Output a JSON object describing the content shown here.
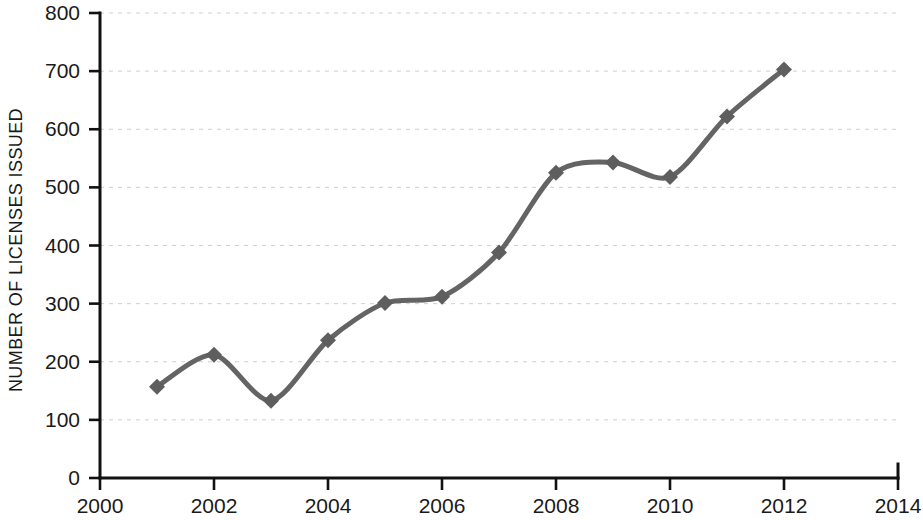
{
  "chart_data": {
    "type": "line",
    "title": "",
    "xlabel": "",
    "ylabel": "NUMBER OF LICENSES ISSUED",
    "xlim": [
      2000,
      2014
    ],
    "ylim": [
      0,
      800
    ],
    "x_ticks": [
      "2000",
      "2002",
      "2004",
      "2006",
      "2008",
      "2010",
      "2012",
      "2014"
    ],
    "x_tick_values": [
      2000,
      2002,
      2004,
      2006,
      2008,
      2010,
      2012,
      2014
    ],
    "y_ticks": [
      "0",
      "100",
      "200",
      "300",
      "400",
      "500",
      "600",
      "700",
      "800"
    ],
    "y_tick_values": [
      0,
      100,
      200,
      300,
      400,
      500,
      600,
      700,
      800
    ],
    "grid": true,
    "grid_axis": "y",
    "legend": false,
    "legend_position": "none",
    "marker": "diamond",
    "line_color": "#646464",
    "marker_color": "#5e5e5e",
    "line_width": 5,
    "x": [
      2001,
      2002,
      2003,
      2004,
      2005,
      2006,
      2007,
      2008,
      2009,
      2010,
      2011,
      2012
    ],
    "values": [
      157,
      212,
      133,
      237,
      301,
      312,
      388,
      525,
      543,
      518,
      622,
      703
    ],
    "series": [
      {
        "name": "Number of licenses issued",
        "values": [
          157,
          212,
          133,
          237,
          301,
          312,
          388,
          525,
          543,
          518,
          622,
          703
        ]
      }
    ]
  }
}
